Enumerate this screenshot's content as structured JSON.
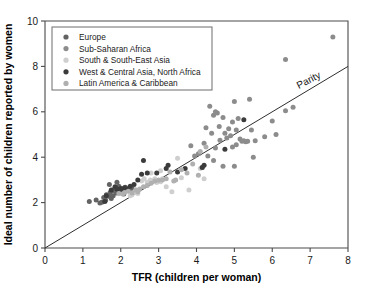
{
  "chart_data": {
    "type": "scatter",
    "title": "",
    "xlabel": "TFR (children per woman)",
    "ylabel": "Ideal number of children reported by women",
    "xlim": [
      0,
      8
    ],
    "ylim": [
      0,
      10
    ],
    "xticks": [
      0,
      1,
      2,
      3,
      4,
      5,
      6,
      7,
      8
    ],
    "yticks": [
      0,
      2,
      4,
      6,
      8,
      10
    ],
    "grid": false,
    "legend_position": "top-left",
    "annotations": [
      {
        "text": "Parity",
        "x": 7.0,
        "y": 7.0,
        "rotation": -27,
        "note": "label on 1:1 reference line"
      }
    ],
    "reference_lines": [
      {
        "name": "parity",
        "type": "line",
        "from": [
          0,
          0
        ],
        "to": [
          8,
          8
        ],
        "color": "#2e2e2e"
      }
    ],
    "series": [
      {
        "name": "Europe",
        "color": "#636363",
        "points": [
          [
            1.17,
            2.05
          ],
          [
            1.35,
            2.12
          ],
          [
            1.45,
            1.98
          ],
          [
            1.5,
            2.02
          ],
          [
            1.55,
            2.22
          ],
          [
            1.6,
            2.1
          ],
          [
            1.62,
            2.35
          ],
          [
            1.68,
            2.28
          ],
          [
            1.72,
            2.45
          ],
          [
            1.75,
            2.18
          ],
          [
            1.78,
            2.52
          ],
          [
            1.8,
            2.3
          ],
          [
            1.84,
            2.62
          ],
          [
            1.88,
            2.42
          ],
          [
            1.92,
            2.55
          ],
          [
            1.95,
            2.72
          ],
          [
            2.0,
            2.48
          ],
          [
            2.05,
            2.6
          ],
          [
            2.08,
            2.38
          ],
          [
            2.12,
            2.68
          ],
          [
            1.7,
            2.8
          ],
          [
            1.9,
            2.9
          ],
          [
            2.2,
            2.52
          ],
          [
            2.3,
            2.62
          ]
        ]
      },
      {
        "name": "Sub-Saharan Africa",
        "color": "#8c8c8c",
        "points": [
          [
            3.85,
            4.5
          ],
          [
            4.05,
            4.15
          ],
          [
            4.2,
            4.62
          ],
          [
            4.35,
            6.25
          ],
          [
            4.4,
            5.05
          ],
          [
            4.45,
            5.85
          ],
          [
            4.5,
            4.4
          ],
          [
            4.55,
            5.95
          ],
          [
            4.6,
            5.35
          ],
          [
            4.62,
            4.75
          ],
          [
            4.7,
            5.75
          ],
          [
            4.75,
            5.05
          ],
          [
            4.8,
            4.85
          ],
          [
            4.85,
            5.25
          ],
          [
            4.9,
            4.95
          ],
          [
            4.95,
            5.55
          ],
          [
            5.0,
            6.45
          ],
          [
            5.05,
            5.2
          ],
          [
            5.1,
            5.7
          ],
          [
            5.15,
            4.8
          ],
          [
            5.2,
            4.7
          ],
          [
            5.25,
            4.72
          ],
          [
            5.3,
            4.68
          ],
          [
            5.35,
            4.7
          ],
          [
            5.4,
            6.55
          ],
          [
            5.45,
            5.2
          ],
          [
            5.5,
            4.0
          ],
          [
            5.55,
            4.72
          ],
          [
            5.8,
            4.9
          ],
          [
            6.0,
            5.6
          ],
          [
            6.1,
            5.0
          ],
          [
            6.35,
            6.05
          ],
          [
            6.55,
            6.2
          ],
          [
            6.35,
            8.3
          ],
          [
            7.6,
            9.3
          ],
          [
            4.25,
            5.3
          ],
          [
            4.5,
            6.0
          ],
          [
            4.95,
            4.45
          ],
          [
            5.05,
            4.55
          ],
          [
            4.3,
            4.05
          ],
          [
            4.7,
            3.6
          ],
          [
            5.0,
            3.6
          ],
          [
            4.45,
            3.85
          ],
          [
            4.15,
            3.55
          ],
          [
            3.95,
            4.05
          ]
        ]
      },
      {
        "name": "South & South-East Asia",
        "color": "#cfcfcf",
        "points": [
          [
            2.55,
            2.95
          ],
          [
            2.62,
            3.05
          ],
          [
            2.7,
            2.9
          ],
          [
            2.78,
            3.0
          ],
          [
            2.85,
            2.95
          ],
          [
            2.9,
            3.05
          ],
          [
            2.95,
            2.88
          ],
          [
            3.0,
            3.0
          ],
          [
            3.05,
            2.92
          ],
          [
            3.1,
            3.05
          ],
          [
            2.35,
            2.45
          ],
          [
            2.45,
            2.4
          ],
          [
            2.4,
            2.55
          ],
          [
            3.2,
            2.7
          ],
          [
            3.35,
            2.48
          ],
          [
            3.5,
            3.95
          ],
          [
            3.6,
            3.1
          ],
          [
            3.8,
            2.55
          ],
          [
            4.1,
            3.5
          ],
          [
            4.2,
            3.05
          ],
          [
            2.25,
            2.3
          ],
          [
            2.3,
            2.35
          ],
          [
            3.05,
            3.4
          ],
          [
            2.8,
            3.3
          ]
        ]
      },
      {
        "name": "West & Central Asia, North Africa",
        "color": "#3b3b3b",
        "points": [
          [
            1.58,
            2.05
          ],
          [
            1.62,
            2.3
          ],
          [
            1.75,
            2.55
          ],
          [
            1.85,
            2.7
          ],
          [
            1.9,
            2.6
          ],
          [
            2.0,
            2.62
          ],
          [
            2.05,
            2.58
          ],
          [
            2.1,
            2.65
          ],
          [
            2.18,
            2.6
          ],
          [
            2.25,
            2.72
          ],
          [
            2.35,
            2.8
          ],
          [
            2.45,
            3.0
          ],
          [
            2.55,
            3.25
          ],
          [
            2.6,
            3.85
          ],
          [
            2.7,
            3.3
          ],
          [
            2.95,
            3.3
          ],
          [
            3.2,
            3.5
          ],
          [
            3.25,
            3.65
          ],
          [
            3.5,
            3.35
          ],
          [
            3.7,
            3.5
          ],
          [
            4.15,
            3.55
          ],
          [
            4.2,
            3.65
          ],
          [
            5.25,
            5.65
          ],
          [
            4.75,
            4.35
          ]
        ]
      },
      {
        "name": "Latin America & Caribbean",
        "color": "#b0b0b0",
        "points": [
          [
            2.1,
            2.45
          ],
          [
            2.2,
            2.5
          ],
          [
            2.3,
            2.42
          ],
          [
            2.4,
            2.55
          ],
          [
            2.5,
            2.6
          ],
          [
            2.6,
            2.7
          ],
          [
            2.7,
            2.75
          ],
          [
            2.8,
            2.85
          ],
          [
            2.9,
            2.95
          ],
          [
            3.0,
            2.98
          ],
          [
            3.1,
            3.0
          ],
          [
            3.2,
            3.05
          ],
          [
            3.3,
            3.35
          ],
          [
            3.45,
            3.0
          ],
          [
            3.6,
            3.45
          ],
          [
            3.75,
            3.3
          ],
          [
            3.9,
            3.7
          ],
          [
            4.05,
            3.2
          ],
          [
            4.1,
            4.25
          ],
          [
            4.25,
            4.45
          ],
          [
            1.95,
            2.4
          ],
          [
            2.05,
            2.38
          ],
          [
            3.4,
            2.95
          ],
          [
            2.45,
            2.48
          ]
        ]
      }
    ]
  },
  "legend": {
    "items": [
      {
        "label": "Europe",
        "color": "#636363"
      },
      {
        "label": "Sub-Saharan Africa",
        "color": "#8c8c8c"
      },
      {
        "label": "South & South-East Asia",
        "color": "#cfcfcf"
      },
      {
        "label": "West & Central Asia, North Africa",
        "color": "#3b3b3b"
      },
      {
        "label": "Latin America & Caribbean",
        "color": "#b0b0b0"
      }
    ]
  }
}
